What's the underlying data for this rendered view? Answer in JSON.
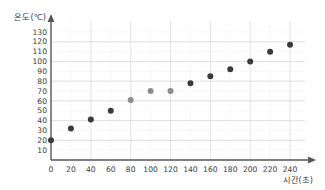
{
  "chart_data": {
    "type": "scatter",
    "title": "",
    "xlabel": "시간(초)",
    "ylabel": "온도(℃)",
    "xlim": [
      0,
      250
    ],
    "ylim": [
      0,
      135
    ],
    "grid": true,
    "legend": "none",
    "x_ticks": [
      0,
      20,
      40,
      60,
      80,
      100,
      120,
      140,
      160,
      180,
      200,
      220,
      240
    ],
    "y_ticks": [
      10,
      20,
      30,
      40,
      50,
      60,
      70,
      80,
      90,
      100,
      110,
      120,
      130
    ],
    "x": [
      0,
      20,
      40,
      60,
      80,
      100,
      120,
      140,
      160,
      180,
      200,
      220,
      240
    ],
    "values": [
      20,
      32,
      41,
      50,
      61,
      70,
      70,
      78,
      85,
      92,
      100,
      110,
      117
    ],
    "point_colors": [
      "#3a3a3a",
      "#3a3a3a",
      "#3a3a3a",
      "#3a3a3a",
      "#8d8d8d",
      "#8d8d8d",
      "#8d8d8d",
      "#3a3a3a",
      "#3a3a3a",
      "#3a3a3a",
      "#3a3a3a",
      "#3a3a3a",
      "#3a3a3a"
    ],
    "series": [
      {
        "name": "온도",
        "values": [
          20,
          32,
          41,
          50,
          61,
          70,
          70,
          78,
          85,
          92,
          100,
          110,
          117
        ]
      }
    ]
  },
  "colors": {
    "dot_dark": "#3a3a3a",
    "dot_light": "#8d8d8d",
    "grid_major": "#c9c9c9",
    "grid_minor": "#dcdcdc",
    "axis": "#555555",
    "text": "#3a3a3a",
    "background": "#ffffff"
  },
  "axes": {
    "y_axis_title": "온도(℃)",
    "x_axis_title": "시간(초)"
  }
}
